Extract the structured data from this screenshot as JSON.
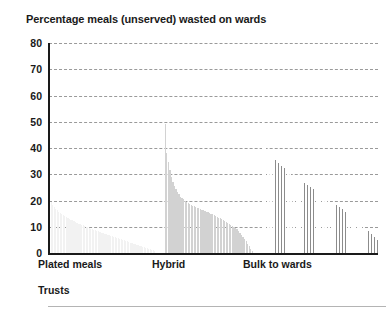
{
  "chart_data": {
    "type": "bar",
    "title": "Percentage meals (unserved) wasted on wards",
    "xlabel": "Trusts",
    "ylabel": "",
    "ylim": [
      0,
      80
    ],
    "yticks": [
      0,
      10,
      20,
      30,
      40,
      50,
      60,
      70,
      80
    ],
    "ytick_labels": [
      "0",
      "10",
      "20",
      "30",
      "40",
      "50",
      "60",
      "70",
      "80"
    ],
    "grid": true,
    "legend": "none",
    "group_labels": [
      "Plated meals",
      "Hybrid",
      "Bulk to wards"
    ],
    "group_colors": [
      "#f2f2f2",
      "#d2d2d2",
      "#8c8c8c"
    ],
    "groups": [
      {
        "name": "Plated meals",
        "color": "#f2f2f2",
        "values": [
          21.0,
          19.6,
          18.4,
          17.5,
          16.8,
          16.2,
          15.7,
          15.2,
          14.8,
          14.4,
          14.0,
          13.7,
          13.3,
          13.0,
          12.7,
          12.4,
          12.1,
          11.8,
          11.5,
          11.2,
          11.0,
          10.7,
          10.5,
          10.2,
          10.0,
          9.8,
          9.5,
          9.3,
          9.1,
          8.9,
          8.6,
          8.4,
          8.2,
          8.0,
          7.8,
          7.6,
          7.4,
          7.2,
          7.0,
          6.8,
          6.6,
          6.4,
          6.2,
          6.0,
          5.8,
          5.6,
          5.4,
          5.2,
          5.0,
          4.8,
          4.6,
          4.4,
          4.2,
          4.0,
          3.8,
          3.6,
          3.4,
          3.2,
          3.0,
          2.8,
          2.6,
          2.4,
          2.2,
          2.0,
          1.8,
          1.6,
          1.4,
          1.2,
          1.0,
          0.8
        ]
      },
      {
        "name": "Hybrid",
        "color": "#d2d2d2",
        "values": [
          49.0,
          38.0,
          34.5,
          31.5,
          29.0,
          27.0,
          25.5,
          24.2,
          23.2,
          22.3,
          21.5,
          20.9,
          20.4,
          20.0,
          19.6,
          19.2,
          18.8,
          18.4,
          18.1,
          17.8,
          17.5,
          17.2,
          17.0,
          16.8,
          16.5,
          16.2,
          16.0,
          15.8,
          15.5,
          15.2,
          15.0,
          14.7,
          14.4,
          14.1,
          13.8,
          13.5,
          13.2,
          12.9,
          12.6,
          12.3,
          12.0,
          11.6,
          11.2,
          10.8,
          10.4,
          10.0,
          9.5,
          9.0,
          8.4,
          7.8,
          7.0,
          6.2,
          5.4,
          4.5,
          3.5,
          2.5,
          1.5,
          0.7
        ]
      },
      {
        "name": "Bulk to wards",
        "color": "#8c8c8c",
        "values": [
          74.0,
          41.0,
          40.0,
          39.2,
          38.4,
          37.6,
          36.9,
          36.2,
          35.6,
          35.0,
          34.4,
          33.8,
          33.2,
          32.7,
          32.2,
          31.7,
          31.2,
          30.7,
          30.2,
          29.8,
          29.4,
          29.0,
          28.6,
          28.2,
          27.8,
          27.4,
          27.0,
          26.6,
          26.2,
          25.8,
          25.4,
          25.0,
          24.6,
          24.2,
          23.8,
          23.4,
          23.0,
          22.6,
          22.2,
          21.8,
          21.4,
          21.0,
          20.6,
          20.2,
          19.8,
          19.4,
          19.0,
          18.6,
          18.2,
          17.8,
          17.4,
          17.0,
          16.6,
          16.2,
          15.8,
          15.4,
          15.0,
          14.6,
          14.2,
          13.8,
          13.3,
          12.8,
          12.3,
          11.8,
          11.3,
          10.8,
          10.2,
          9.6,
          9.0,
          8.4,
          7.8,
          7.2,
          6.6,
          6.0,
          5.4,
          4.8
        ]
      }
    ]
  }
}
